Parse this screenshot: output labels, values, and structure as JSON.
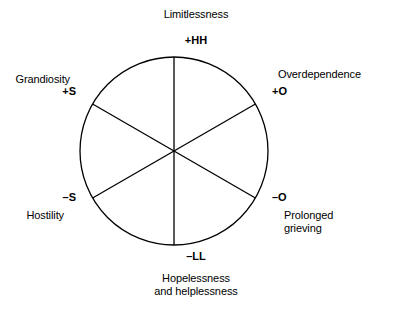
{
  "diagram": {
    "type": "radial-hexant-circle",
    "title_visible": false,
    "geometry": {
      "center_x": 174,
      "center_y": 151,
      "radius": 94,
      "sector_count": 6,
      "line_color": "#000000",
      "background_color": "#ffffff"
    },
    "axes": [
      {
        "id": "limitlessness",
        "tick": "+HH",
        "label": "Limitlessness",
        "angle_deg": 90,
        "position": "top"
      },
      {
        "id": "overdependence",
        "tick": "+O",
        "label": "Overdependence",
        "angle_deg": 30,
        "position": "upper-right"
      },
      {
        "id": "prolonged-grieving",
        "tick": "–O",
        "label_line_1": "Prolonged",
        "label_line_2": "grieving",
        "angle_deg": -30,
        "position": "lower-right"
      },
      {
        "id": "hopelessness-helplessness",
        "tick": "–LL",
        "label_line_1": "Hopelessness",
        "label_line_2": "and helplessness",
        "angle_deg": -90,
        "position": "bottom"
      },
      {
        "id": "hostility",
        "tick": "–S",
        "label": "Hostility",
        "angle_deg": -150,
        "position": "lower-left"
      },
      {
        "id": "grandiosity",
        "tick": "+S",
        "label": "Grandiosity",
        "angle_deg": 150,
        "position": "upper-left"
      }
    ]
  }
}
